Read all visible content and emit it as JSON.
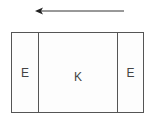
{
  "diagram": {
    "arrow": {
      "direction": "left",
      "color": "#333333"
    },
    "box": {
      "segments": [
        {
          "label": "E"
        },
        {
          "label": "K"
        },
        {
          "label": "E"
        }
      ]
    }
  }
}
